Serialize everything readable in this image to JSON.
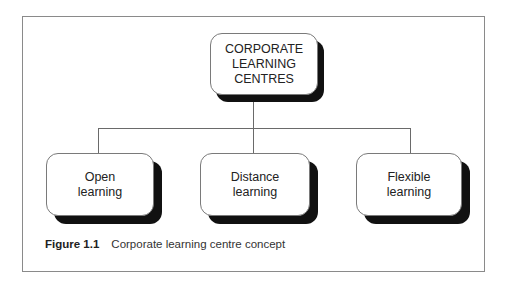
{
  "diagram": {
    "type": "hierarchy",
    "root": {
      "id": "root",
      "label": "CORPORATE\nLEARNING\nCENTRES"
    },
    "children": [
      {
        "id": "open",
        "label": "Open\nlearning"
      },
      {
        "id": "distance",
        "label": "Distance\nlearning"
      },
      {
        "id": "flexible",
        "label": "Flexible\nlearning"
      }
    ],
    "edges": [
      {
        "from": "root",
        "to": "open"
      },
      {
        "from": "root",
        "to": "distance"
      },
      {
        "from": "root",
        "to": "flexible"
      }
    ]
  },
  "caption": {
    "label": "Figure 1.1",
    "text": "Corporate learning centre concept"
  },
  "colors": {
    "shadow": "#111111",
    "border": "#7a7a7a",
    "line": "#6a6a6a",
    "frame": "#8a8a8a"
  }
}
